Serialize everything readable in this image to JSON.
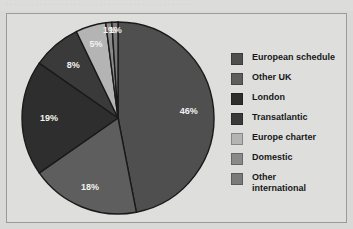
{
  "top_fragment": {
    "text": "· · · · · · · · · · · · · · · · · · · · · · · · · · · · · · · · · · · · · · · · · · · ·"
  },
  "chart_data": {
    "type": "pie",
    "title": "",
    "subtitle": "",
    "xlabel": "",
    "ylabel": "",
    "legend_position": "right",
    "grid": false,
    "start_angle_deg": 0,
    "direction": "clockwise",
    "unit": "%",
    "categories": [
      "European schedule",
      "Other UK",
      "London",
      "Transatlantic",
      "Europe charter",
      "Domestic",
      "Other international"
    ],
    "values": [
      46,
      18,
      19,
      8,
      5,
      1,
      1
    ],
    "data_labels": [
      "46%",
      "18%",
      "19%",
      "8%",
      "5%",
      "1%",
      "1%"
    ],
    "colors": [
      "#4f4f4f",
      "#5e5e5e",
      "#2e2e2e",
      "#3a3a3a",
      "#b4b4b4",
      "#8a8a8a",
      "#7a7a7a"
    ],
    "slice_order_clockwise_from_top": [
      "European schedule",
      "Other UK",
      "London",
      "Transatlantic",
      "Europe charter",
      "Domestic",
      "Other international"
    ]
  },
  "legend": {
    "items": [
      {
        "label": "European schedule",
        "color": "#4f4f4f"
      },
      {
        "label": "Other UK",
        "color": "#5e5e5e"
      },
      {
        "label": "London",
        "color": "#2e2e2e"
      },
      {
        "label": "Transatlantic",
        "color": "#3a3a3a"
      },
      {
        "label": "Europe charter",
        "color": "#b4b4b4"
      },
      {
        "label": "Domestic",
        "color": "#8a8a8a"
      },
      {
        "label": "Other\ninternational",
        "color": "#7a7a7a"
      }
    ]
  },
  "style": {
    "page_background": "#d9d9d7",
    "figure_background": "#dededc",
    "figure_border": "#9a9a98",
    "label_color": "#f2f2f0",
    "slice_outline": "#1a1a1a"
  }
}
